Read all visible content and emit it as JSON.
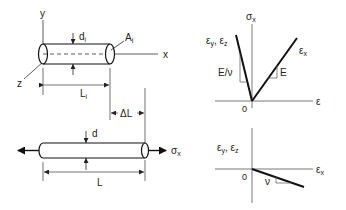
{
  "figure": {
    "top_bar": {
      "axes": {
        "y": "y",
        "x": "x",
        "z": "z"
      },
      "diameter_label": "d",
      "diameter_sub": "i",
      "area_label": "A",
      "area_sub": "i",
      "length_label": "L",
      "length_sub": "i"
    },
    "elongation_label": "ΔL",
    "bottom_bar": {
      "diameter_label": "d",
      "length_label": "L",
      "stress_label": "σ",
      "stress_sub": "x"
    },
    "graph_stress_strain": {
      "y_axis_label": "σ",
      "y_axis_sub": "x",
      "x_axis_label": "ε",
      "origin_label": "0",
      "line_left_label": "ε",
      "line_left_sub1": "y",
      "line_left_sep": ", ε",
      "line_left_sub2": "z",
      "line_right_label": "ε",
      "line_right_sub": "x",
      "slope_left_label": "E/ν",
      "slope_right_label": "E"
    },
    "graph_poisson": {
      "y_axis_label": "ε",
      "y_axis_sub1": "y",
      "y_axis_sep": ", ε",
      "y_axis_sub2": "z",
      "x_axis_label": "ε",
      "x_axis_sub": "x",
      "origin_label": "0",
      "slope_label": "ν"
    },
    "colors": {
      "line": "#111111",
      "axis": "#555555",
      "background": "#ffffff"
    }
  }
}
